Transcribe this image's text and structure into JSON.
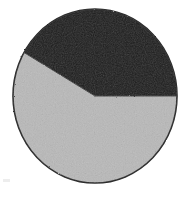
{
  "image": {
    "width": 188,
    "height": 197,
    "background_color": "#ffffff",
    "title": "",
    "caption": ""
  },
  "chart_data": {
    "type": "pie",
    "title": "",
    "subtitle": "",
    "xlabel": "",
    "ylabel": "",
    "grid": false,
    "legend_position": "none",
    "labels": [
      "Slice 1",
      "Slice 2"
    ],
    "categories": [
      "Slice 1",
      "Slice 2"
    ],
    "values": [
      42,
      58
    ],
    "units": "percent",
    "colors": [
      "#1c1c1c",
      "#b9b9b9"
    ],
    "slices": [
      {
        "name": "Slice 1",
        "value": 42,
        "percent": "42%",
        "color": "#1c1c1c",
        "start_angle_deg": 210,
        "end_angle_deg": 360,
        "sweep_deg": 150,
        "label": ""
      },
      {
        "name": "Slice 2",
        "value": 58,
        "percent": "58%",
        "color": "#b9b9b9",
        "start_angle_deg": 0,
        "end_angle_deg": 210,
        "sweep_deg": 210,
        "label": ""
      }
    ],
    "geometry": {
      "center_x": 95,
      "center_y": 96,
      "radius_x": 82,
      "radius_y": 87,
      "start_angle_deg": 0,
      "direction": "clockwise"
    },
    "outline_color": "#2a2a2a",
    "outline_width": 1.6,
    "annotations": []
  },
  "artifacts": {
    "speckle_label": "scan-speckle",
    "speckle_color": "#ededed"
  }
}
